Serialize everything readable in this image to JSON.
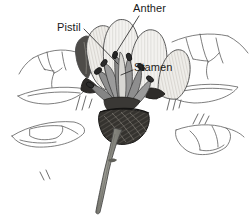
{
  "figure": {
    "kind": "botanical-line-drawing",
    "width": 252,
    "height": 223,
    "background_color": "#ffffff",
    "line_color": "#3a3a3a"
  },
  "labels": [
    {
      "id": "anther",
      "text": "Anther",
      "x": 133,
      "y": 3,
      "leader_from": [
        139,
        16
      ],
      "leader_to": [
        114,
        56
      ]
    },
    {
      "id": "pistil",
      "text": "Pistil",
      "x": 57,
      "y": 22,
      "leader_from": [
        84,
        29
      ],
      "leader_to": [
        118,
        64
      ]
    },
    {
      "id": "stamen",
      "text": "Stamen",
      "x": 134,
      "y": 62,
      "leader_from": [
        133,
        70
      ],
      "leader_to": [
        120,
        74
      ]
    }
  ],
  "parts": {
    "petals": {
      "name": "petals",
      "fill": "#f2f1ee",
      "stroke": "#4a4a4a",
      "striation_color": "#c9c7c2",
      "count": 5
    },
    "stamens": {
      "name": "stamen cluster",
      "fill": "#8e8e8e",
      "stroke": "#3c3c3c"
    },
    "anthers": {
      "name": "anthers",
      "fill": "#2b2b2b",
      "stroke": "#1c1c1c"
    },
    "calyx": {
      "name": "calyx",
      "fill": "#33312e",
      "stroke": "#1c1c1c"
    },
    "stem": {
      "name": "stem",
      "fill": "#8d8d85",
      "stroke": "#4a4a48"
    },
    "leaves": {
      "name": "leaves and branches",
      "fill": "#ffffff",
      "stroke": "#5a5a5a"
    }
  },
  "colors": {
    "ink": "#3a3a3a",
    "dark_ink": "#1c1c1c",
    "petal_fill": "#f2f1ee",
    "stamen_gray": "#8e8e8e",
    "anther_dark": "#2b2b2b",
    "stem_green_gray": "#8d8d85",
    "background": "#ffffff",
    "text": "#1a1a1a"
  }
}
